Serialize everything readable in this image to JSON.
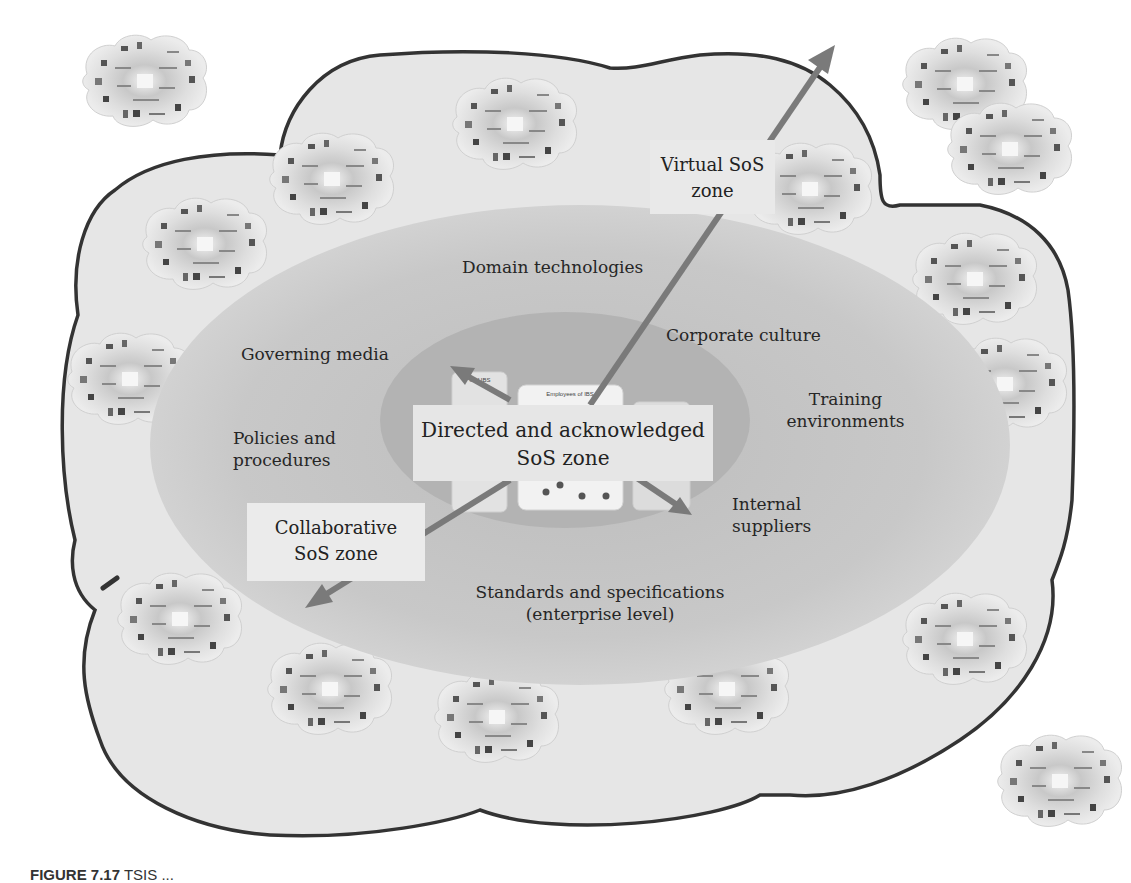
{
  "diagram": {
    "outer_cloud": {
      "fill": "#e6e6e6",
      "stroke": "#333333"
    },
    "ellipses": {
      "outer": {
        "fill": "#c9c9c9"
      },
      "inner": {
        "fill": "#b4b4b4"
      }
    },
    "arrow_color": "#7a7a7a",
    "labels": {
      "domain_technologies": "Domain technologies",
      "governing_media": "Governing media",
      "corporate_culture": "Corporate culture",
      "training_line1": "Training",
      "training_line2": "environments",
      "policies_line1": "Policies and",
      "policies_line2": "procedures",
      "internal_line1": "Internal",
      "internal_line2": "suppliers",
      "standards_line1": "Standards and specifications",
      "standards_line2": "(enterprise level)"
    },
    "zones": {
      "virtual": {
        "line1": "Virtual SoS",
        "line2": "zone"
      },
      "directed": {
        "line1": "Directed and acknowledged",
        "line2": "SoS zone"
      },
      "collaborative": {
        "line1": "Collaborative",
        "line2": "SoS zone"
      }
    },
    "center_panels": {
      "left_title": "...s of IBS",
      "middle_title": "Employees of IBS",
      "right_title": "...ppliers &"
    },
    "mini_clouds_count": 20
  },
  "caption": {
    "prefix": "FIGURE 7.17",
    "text": "TSIS ..."
  }
}
